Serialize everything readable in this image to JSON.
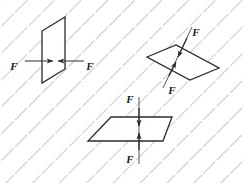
{
  "figure": {
    "background_color": "#ffffff",
    "hatch": {
      "name": "diagonal-dash-hatch",
      "color": "#9a9a9a",
      "stroke_width": 1.1,
      "dash": "17 13",
      "angle_label": "down-right diagonal",
      "spacing": 19
    },
    "line_color": "#2b2b2b",
    "arrow_color": "#2b2b2b"
  },
  "planes": [
    {
      "id": "left-plane",
      "name": "vertical-plane",
      "orientation": "vertical",
      "points": "65,17 42,31 42,83 65,69",
      "force": {
        "direction": "horizontal-inward",
        "labels": [
          {
            "text": "F",
            "x": 14,
            "y": 70
          },
          {
            "text": "F",
            "x": 76,
            "y": 70
          }
        ]
      }
    },
    {
      "id": "right-plane",
      "name": "inclined-plane",
      "orientation": "inclined",
      "points": "147,57 176,45 219,68 190,80",
      "force": {
        "direction": "diagonal-inward",
        "labels": [
          {
            "text": "F",
            "x": 193,
            "y": 46
          },
          {
            "text": "F",
            "x": 170,
            "y": 93
          }
        ]
      }
    },
    {
      "id": "bottom-plane",
      "name": "horizontal-plane",
      "orientation": "horizontal",
      "points": "111,117 172,117 163,141 88,141",
      "force": {
        "direction": "vertical-inward",
        "labels": [
          {
            "text": "F",
            "x": 118,
            "y": 103
          },
          {
            "text": "F",
            "x": 118,
            "y": 160
          }
        ]
      }
    }
  ],
  "labels": {
    "force_symbol": "F",
    "all": [
      "F",
      "F",
      "F",
      "F",
      "F",
      "F"
    ]
  }
}
